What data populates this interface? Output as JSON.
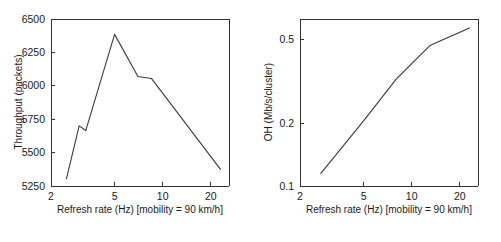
{
  "figure": {
    "background_color": "#ffffff",
    "line_color": "#3a3a3a",
    "axis_color": "#333333",
    "panel_count": 2
  },
  "chart_data": [
    {
      "type": "line",
      "panel": "left",
      "title": "",
      "xlabel": "Refresh rate (Hz) [mobility = 90 km/h]",
      "ylabel": "Throughput (packets)",
      "xscale": "log",
      "yscale": "linear",
      "xlim": [
        2,
        26
      ],
      "ylim": [
        5250,
        6500
      ],
      "xticks": [
        2,
        5,
        10,
        20
      ],
      "xticklabels": [
        "2",
        "5",
        "10",
        "20"
      ],
      "yticks": [
        5250,
        5500,
        5750,
        6000,
        6250,
        6500
      ],
      "yticklabels": [
        "5250",
        "5500",
        "5750",
        "6000",
        "6250",
        "6500"
      ],
      "grid": false,
      "legend": "none",
      "series": [
        {
          "name": "Throughput",
          "x": [
            2.5,
            3.0,
            3.3,
            5.0,
            7.0,
            8.5,
            23.0
          ],
          "y": [
            5305,
            5700,
            5665,
            6385,
            6070,
            6055,
            5375
          ]
        }
      ]
    },
    {
      "type": "line",
      "panel": "right",
      "title": "",
      "xlabel": "Refresh rate (Hz) [mobility = 90 km/h]",
      "ylabel": "OH (Mb/s/cluster)",
      "xscale": "log",
      "yscale": "log",
      "xlim": [
        2,
        26
      ],
      "ylim": [
        0.1,
        0.63
      ],
      "xticks": [
        2,
        5,
        10,
        20
      ],
      "xticklabels": [
        "2",
        "5",
        "10",
        "20"
      ],
      "yticks": [
        0.1,
        0.2,
        0.5
      ],
      "yticklabels": [
        "0.1",
        "0.2",
        "0.5"
      ],
      "grid": false,
      "legend": "none",
      "series": [
        {
          "name": "OH",
          "x": [
            2.7,
            5.0,
            8.0,
            10.0,
            13.0,
            17.0,
            23.0
          ],
          "y": [
            0.115,
            0.205,
            0.325,
            0.385,
            0.47,
            0.515,
            0.57
          ]
        }
      ]
    }
  ]
}
